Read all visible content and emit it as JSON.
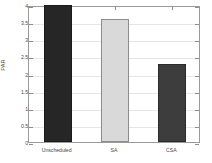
{
  "chart_data": {
    "type": "bar",
    "title": "",
    "xlabel": "",
    "ylabel": "PAR",
    "categories": [
      "Unscheduled",
      "SA",
      "CSA"
    ],
    "values": [
      4.0,
      3.59,
      2.28
    ],
    "ylim": [
      0,
      4
    ],
    "yticks": [
      0,
      0.5,
      1,
      1.5,
      2,
      2.5,
      3,
      3.5,
      4
    ],
    "ytick_labels": [
      "0",
      "0.5",
      "1",
      "1.5",
      "2",
      "2.5",
      "3",
      "3.5",
      "4"
    ],
    "grid": true,
    "legend": null,
    "bar_colors": [
      "#262626",
      "#d9d9d9",
      "#3d3d3d"
    ],
    "bar_edge_colors": [
      "#1a1a1a",
      "#8c8c8c",
      "#2b2b2b"
    ],
    "axis_color": "#9a9a9a",
    "grid_color": "#e6e6e6",
    "background": "#ffffff"
  }
}
